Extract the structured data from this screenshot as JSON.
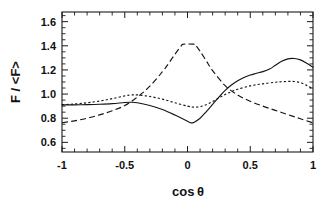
{
  "chart_data": {
    "type": "line",
    "title": "",
    "xlabel": "cosθ",
    "ylabel": "F / <F>",
    "xlim": [
      -1,
      1
    ],
    "ylim": [
      0.52,
      1.68
    ],
    "grid": false,
    "legend": "none",
    "xticks": [
      -1,
      -0.5,
      0,
      0.5,
      1
    ],
    "xtick_labels": [
      "-1",
      "-0.5",
      "0",
      "0.5",
      "1"
    ],
    "yticks": [
      0.6,
      0.8,
      1.0,
      1.2,
      1.4,
      1.6
    ],
    "ytick_labels": [
      "0.6",
      "0.8",
      "1.0",
      "1.2",
      "1.4",
      "1.6"
    ],
    "x_minor_step": 0.1,
    "y_minor_step": 0.05,
    "series": [
      {
        "name": "solid",
        "style": "solid",
        "color": "#151515",
        "x": [
          -1.0,
          -0.9,
          -0.8,
          -0.7,
          -0.6,
          -0.5,
          -0.45,
          -0.4,
          -0.3,
          -0.2,
          -0.1,
          0.0,
          0.02,
          0.05,
          0.1,
          0.15,
          0.2,
          0.25,
          0.3,
          0.35,
          0.4,
          0.45,
          0.5,
          0.55,
          0.6,
          0.65,
          0.7,
          0.75,
          0.8,
          0.85,
          0.9,
          0.95,
          1.0
        ],
        "values": [
          0.91,
          0.911,
          0.913,
          0.916,
          0.921,
          0.93,
          0.932,
          0.928,
          0.905,
          0.872,
          0.826,
          0.775,
          0.762,
          0.765,
          0.8,
          0.855,
          0.915,
          0.975,
          1.03,
          1.075,
          1.11,
          1.138,
          1.158,
          1.172,
          1.186,
          1.205,
          1.238,
          1.272,
          1.292,
          1.295,
          1.283,
          1.255,
          1.222
        ]
      },
      {
        "name": "dotted",
        "style": "dotted",
        "color": "#151515",
        "x": [
          -1.0,
          -0.9,
          -0.8,
          -0.7,
          -0.6,
          -0.5,
          -0.45,
          -0.4,
          -0.3,
          -0.2,
          -0.1,
          0.0,
          0.05,
          0.1,
          0.15,
          0.2,
          0.25,
          0.3,
          0.35,
          0.4,
          0.5,
          0.6,
          0.7,
          0.75,
          0.8,
          0.85,
          0.9,
          0.95,
          1.0
        ],
        "values": [
          0.912,
          0.918,
          0.928,
          0.942,
          0.962,
          0.985,
          0.992,
          0.993,
          0.98,
          0.958,
          0.928,
          0.9,
          0.892,
          0.895,
          0.912,
          0.938,
          0.968,
          0.996,
          1.02,
          1.04,
          1.068,
          1.085,
          1.098,
          1.102,
          1.105,
          1.104,
          1.095,
          1.072,
          1.04
        ]
      },
      {
        "name": "dashed",
        "style": "dashed",
        "color": "#151515",
        "x": [
          -1.0,
          -0.9,
          -0.8,
          -0.7,
          -0.6,
          -0.5,
          -0.4,
          -0.3,
          -0.2,
          -0.15,
          -0.1,
          -0.05,
          -0.04,
          0.0,
          0.05,
          0.06,
          0.1,
          0.15,
          0.2,
          0.3,
          0.4,
          0.5,
          0.6,
          0.7,
          0.8,
          0.9,
          1.0
        ],
        "values": [
          0.762,
          0.778,
          0.8,
          0.828,
          0.862,
          0.905,
          0.975,
          1.065,
          1.185,
          1.255,
          1.33,
          1.4,
          1.412,
          1.415,
          1.414,
          1.412,
          1.355,
          1.275,
          1.195,
          1.07,
          0.992,
          0.94,
          0.9,
          0.865,
          0.83,
          0.795,
          0.762
        ]
      }
    ]
  },
  "axes": {
    "y_axis_title": "F / <F>",
    "x_axis_title_base": "cos",
    "x_axis_title_symbol": "θ"
  }
}
